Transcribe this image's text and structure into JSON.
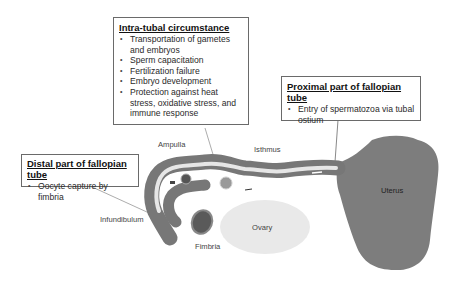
{
  "boxes": {
    "intra_tubal": {
      "title": "Intra-tubal circumstance",
      "items": [
        "Transportation of gametes and embryos",
        "Sperm capacitation",
        "Fertilization failure",
        "Embryo development",
        "Protection against heat stress, oxidative stress, and immune response"
      ]
    },
    "proximal": {
      "title": "Proximal part of fallopian tube",
      "items": [
        "Entry of spermatozoa via tubal ostium"
      ]
    },
    "distal": {
      "title": "Distal part of fallopian tube",
      "items": [
        "Oocyte capture by fimbria"
      ]
    }
  },
  "labels": {
    "ampulla": "Ampulla",
    "isthmus": "Isthmus",
    "uterus": "Uterus",
    "ovary": "Ovary",
    "infundibulum": "Infundibulum",
    "fimbria": "Fimbria"
  },
  "colors": {
    "tube": "#7a7a7a",
    "lumen": "#e8e8e8",
    "uterus": "#7d7d7d",
    "ovary": "#e9e9e9",
    "border": "#6a6a6a"
  }
}
